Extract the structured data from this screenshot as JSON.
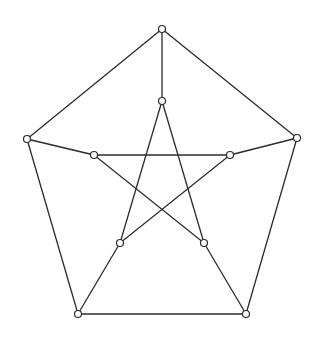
{
  "diagram": {
    "name": "Petersen graph",
    "colors": {
      "edge": "#2b2b2b",
      "node_fill": "#ffffff",
      "node_stroke": "#2b2b2b",
      "background": "#ffffff"
    },
    "node_radius": 3.5,
    "nodes": [
      {
        "id": "o0",
        "x": 162,
        "y": 29
      },
      {
        "id": "o1",
        "x": 297,
        "y": 138
      },
      {
        "id": "o2",
        "x": 246,
        "y": 314
      },
      {
        "id": "o3",
        "x": 78,
        "y": 314
      },
      {
        "id": "o4",
        "x": 27,
        "y": 139
      },
      {
        "id": "i0",
        "x": 162,
        "y": 101
      },
      {
        "id": "i1",
        "x": 230,
        "y": 155
      },
      {
        "id": "i2",
        "x": 204,
        "y": 243
      },
      {
        "id": "i3",
        "x": 120,
        "y": 243
      },
      {
        "id": "i4",
        "x": 94,
        "y": 155
      }
    ],
    "edges": [
      [
        "o0",
        "o1"
      ],
      [
        "o1",
        "o2"
      ],
      [
        "o2",
        "o3"
      ],
      [
        "o3",
        "o4"
      ],
      [
        "o4",
        "o0"
      ],
      [
        "o0",
        "i0"
      ],
      [
        "o1",
        "i1"
      ],
      [
        "o2",
        "i2"
      ],
      [
        "o3",
        "i3"
      ],
      [
        "o4",
        "i4"
      ],
      [
        "i0",
        "i2"
      ],
      [
        "i2",
        "i4"
      ],
      [
        "i4",
        "i1"
      ],
      [
        "i1",
        "i3"
      ],
      [
        "i3",
        "i0"
      ]
    ]
  }
}
